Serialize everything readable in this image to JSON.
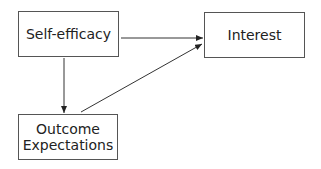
{
  "nodes": {
    "self_efficacy": {
      "label": "Self-efficacy"
    },
    "interest": {
      "label": "Interest"
    },
    "outcome_line1": "Outcome",
    "outcome_line2": "Expectations"
  },
  "edges": [
    {
      "from": "Self-efficacy",
      "to": "Interest"
    },
    {
      "from": "Self-efficacy",
      "to": "Outcome Expectations"
    },
    {
      "from": "Outcome Expectations",
      "to": "Interest"
    }
  ],
  "colors": {
    "stroke": "#333333",
    "text": "#222222"
  }
}
